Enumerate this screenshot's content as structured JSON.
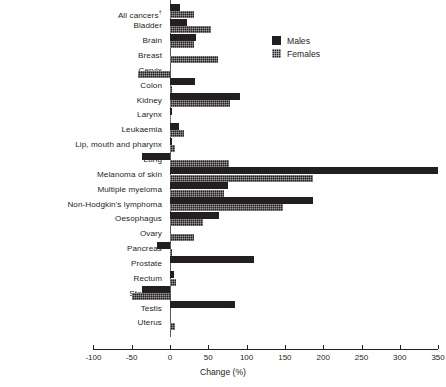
{
  "chart_data": {
    "type": "bar",
    "orientation": "horizontal",
    "title": "",
    "xlabel": "Change (%)",
    "ylabel": "",
    "xlim": [
      -100,
      350
    ],
    "xticks": [
      -100,
      -50,
      0,
      50,
      100,
      150,
      200,
      250,
      300,
      350
    ],
    "xtick_labels": [
      "-100",
      "-50",
      "0",
      "50",
      "100",
      "150",
      "200",
      "250",
      "300",
      "350"
    ],
    "grid": false,
    "legend_position": "upper-right-inside",
    "categories": [
      "All  cancers†",
      "Bladder",
      "Brain",
      "Breast",
      "Cervix",
      "Colon",
      "Kidney",
      "Larynx",
      "Leukaemia",
      "Lip, mouth and pharynx",
      "Lung",
      "Melanoma of skin",
      "Multiple myeloma",
      "Non-Hodgkin's lymphoma",
      "Oesophagus",
      "Ovary",
      "Pancreas",
      "Prostate",
      "Rectum",
      "Stomach",
      "Testis",
      "Uterus"
    ],
    "series": [
      {
        "name": "Males",
        "values": [
          13,
          22,
          34,
          null,
          null,
          33,
          91,
          2,
          12,
          2,
          -36,
          350,
          76,
          187,
          64,
          null,
          -17,
          110,
          5,
          -37,
          85,
          null
        ]
      },
      {
        "name": "Females",
        "values": [
          31,
          53,
          31,
          63,
          -42,
          2,
          78,
          0,
          18,
          7,
          77,
          187,
          71,
          148,
          43,
          31,
          3,
          null,
          8,
          -50,
          null,
          7
        ]
      }
    ]
  },
  "legend": {
    "items": [
      {
        "label": "Males",
        "pattern": "solid",
        "color": "#231f20"
      },
      {
        "label": "Females",
        "pattern": "hatched",
        "color": "#231f20"
      }
    ]
  },
  "axis": {
    "x_title": "Change (%)"
  }
}
